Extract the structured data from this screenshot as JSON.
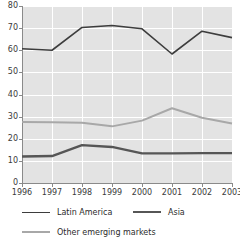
{
  "chart_data": {
    "type": "line",
    "title": "",
    "xlabel": "",
    "ylabel": "",
    "categories": [
      "1996",
      "1997",
      "1998",
      "1999",
      "2000",
      "2001",
      "2002",
      "2003"
    ],
    "ylim": [
      0,
      80
    ],
    "yticks": [
      0,
      10,
      20,
      30,
      40,
      50,
      60,
      70,
      80
    ],
    "ytick_labels": [
      "0",
      "10",
      "20",
      "30",
      "40",
      "50",
      "60",
      "70",
      "80"
    ],
    "grid": true,
    "legend_position": "bottom",
    "series": [
      {
        "name": "Latin America",
        "color": "#3d3d3d",
        "width": 1.6,
        "values": [
          60.7,
          60.0,
          70.3,
          71.2,
          69.7,
          58.3,
          68.6,
          65.7
        ]
      },
      {
        "name": "Asia",
        "color": "#565656",
        "width": 2.4,
        "values": [
          12.0,
          12.2,
          17.1,
          16.3,
          13.4,
          13.4,
          13.5,
          13.5
        ]
      },
      {
        "name": "Other emerging markets",
        "color": "#a8a8a8",
        "width": 2.0,
        "values": [
          27.6,
          27.5,
          27.2,
          25.6,
          28.2,
          33.8,
          29.5,
          26.9
        ]
      }
    ]
  },
  "axes": {
    "background_color": "#e3e3e3",
    "gridline_color": "#ffffff",
    "axis_color": "#8a8a8a",
    "tick_label_color": "#3a3a3a"
  },
  "legend": {
    "items": [
      {
        "label": "Latin America",
        "color": "#3d3d3d",
        "width": "1.6px"
      },
      {
        "label": "Asia",
        "color": "#565656",
        "width": "2.4px"
      },
      {
        "label": "Other emerging markets",
        "color": "#a8a8a8",
        "width": "2px"
      }
    ]
  }
}
